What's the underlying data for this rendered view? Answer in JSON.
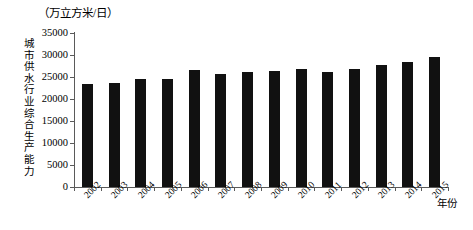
{
  "chart_data": {
    "type": "bar",
    "title": "",
    "unit_caption": "（万立方米/日）",
    "ylabel": "城市供水行业综合生产能力",
    "xlabel": "年份",
    "categories": [
      "2002",
      "2003",
      "2004",
      "2005",
      "2006",
      "2007",
      "2008",
      "2009",
      "2010",
      "2011",
      "2012",
      "2013",
      "2014",
      "2015"
    ],
    "values": [
      23400,
      23700,
      24500,
      24600,
      26500,
      25600,
      26200,
      26300,
      26900,
      26200,
      26900,
      27700,
      28300,
      29500
    ],
    "ylim": [
      0,
      35000
    ],
    "ytick_labels": [
      "0",
      "5000",
      "10000",
      "15000",
      "20000",
      "25000",
      "30000",
      "35000"
    ],
    "ytick_values": [
      0,
      5000,
      10000,
      15000,
      20000,
      25000,
      30000,
      35000
    ],
    "grid": false,
    "legend": null,
    "bar_color": "#111111",
    "axis_color": "#5a5a5a"
  }
}
